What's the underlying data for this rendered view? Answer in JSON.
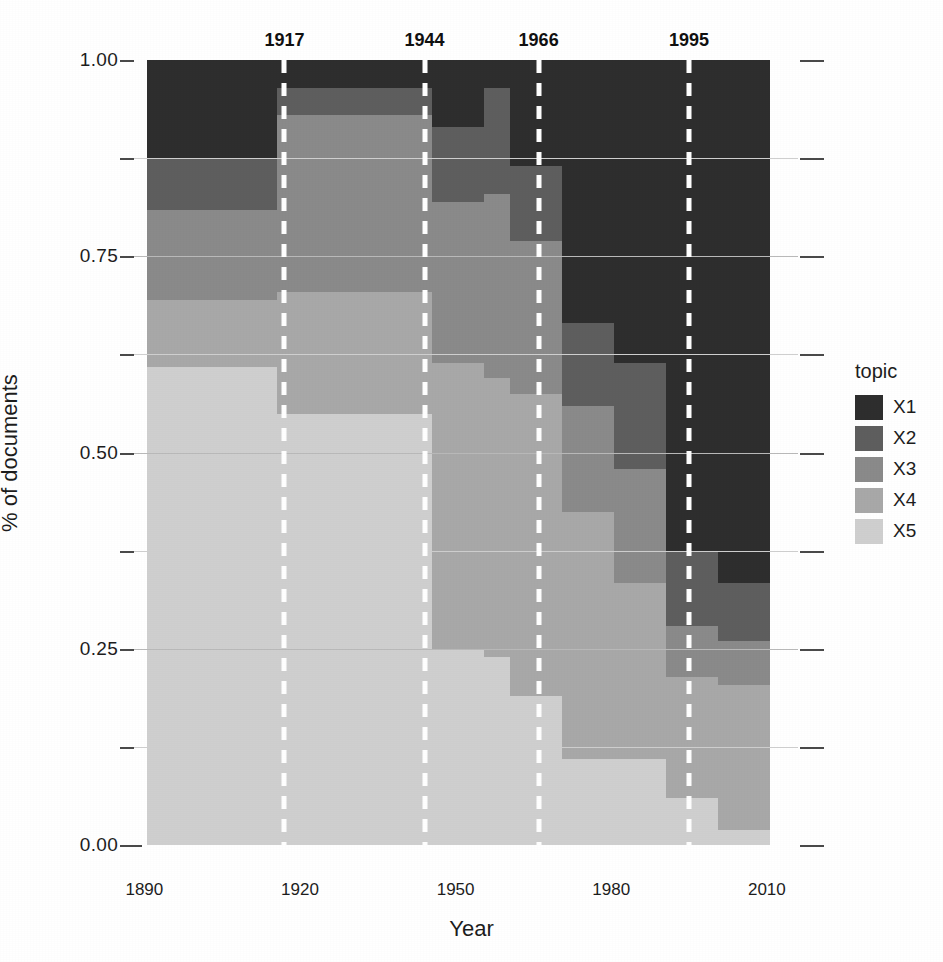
{
  "chart_data": {
    "type": "area",
    "title": "",
    "xlabel": "Year",
    "ylabel": "% of documents",
    "xlim": [
      1888,
      2016
    ],
    "ylim": [
      0,
      1
    ],
    "grid": true,
    "legend_position": "right",
    "legend_title": "topic",
    "x_ticks": [
      "1890",
      "1920",
      "1950",
      "1980",
      "2010"
    ],
    "x_tick_values": [
      1890,
      1920,
      1950,
      1980,
      2010
    ],
    "y_ticks": [
      "0.00",
      "0.25",
      "0.50",
      "0.75",
      "1.00"
    ],
    "y_tick_values": [
      0.0,
      0.25,
      0.5,
      0.75,
      1.0
    ],
    "y_minor_values": [
      0.125,
      0.375,
      0.625,
      0.875
    ],
    "annotations": [
      {
        "label": "1917",
        "x": 1917
      },
      {
        "label": "1944",
        "x": 1944
      },
      {
        "label": "1966",
        "x": 1966
      },
      {
        "label": "1995",
        "x": 1995
      }
    ],
    "bin_width": 5,
    "x_bins": [
      1893,
      1898,
      1903,
      1908,
      1913,
      1918,
      1923,
      1928,
      1933,
      1938,
      1943,
      1948,
      1953,
      1958,
      1963,
      1968,
      1973,
      1978,
      1983,
      1988,
      1993,
      1998,
      2003,
      2008
    ],
    "series": [
      {
        "name": "X1",
        "color": "#2e2e2e",
        "values": [
          0.125,
          0.125,
          0.125,
          0.125,
          0.125,
          0.035,
          0.035,
          0.035,
          0.035,
          0.035,
          0.035,
          0.085,
          0.085,
          0.035,
          0.135,
          0.135,
          0.335,
          0.335,
          0.385,
          0.385,
          0.625,
          0.625,
          0.665,
          0.665
        ]
      },
      {
        "name": "X2",
        "color": "#5e5e5e",
        "values": [
          0.065,
          0.065,
          0.065,
          0.065,
          0.065,
          0.035,
          0.035,
          0.035,
          0.035,
          0.035,
          0.035,
          0.095,
          0.095,
          0.135,
          0.095,
          0.095,
          0.105,
          0.105,
          0.135,
          0.135,
          0.095,
          0.095,
          0.075,
          0.075
        ]
      },
      {
        "name": "X3",
        "color": "#8a8a8a",
        "values": [
          0.115,
          0.115,
          0.115,
          0.115,
          0.115,
          0.225,
          0.225,
          0.225,
          0.225,
          0.225,
          0.225,
          0.205,
          0.205,
          0.235,
          0.195,
          0.195,
          0.135,
          0.135,
          0.145,
          0.145,
          0.065,
          0.065,
          0.055,
          0.055
        ]
      },
      {
        "name": "X4",
        "color": "#a8a8a8",
        "values": [
          0.085,
          0.085,
          0.085,
          0.085,
          0.085,
          0.155,
          0.155,
          0.155,
          0.155,
          0.155,
          0.155,
          0.365,
          0.365,
          0.355,
          0.385,
          0.385,
          0.315,
          0.315,
          0.225,
          0.225,
          0.155,
          0.155,
          0.185,
          0.185
        ]
      },
      {
        "name": "X5",
        "color": "#cfcfcf",
        "values": [
          0.61,
          0.61,
          0.61,
          0.61,
          0.61,
          0.55,
          0.55,
          0.55,
          0.55,
          0.55,
          0.55,
          0.25,
          0.25,
          0.24,
          0.19,
          0.19,
          0.11,
          0.11,
          0.11,
          0.11,
          0.06,
          0.06,
          0.02,
          0.02
        ]
      }
    ]
  },
  "axes": {
    "x_title": "Year",
    "y_title": "% of documents"
  },
  "legend": {
    "title": "topic",
    "items": [
      {
        "label": "X1",
        "color": "#2e2e2e"
      },
      {
        "label": "X2",
        "color": "#5e5e5e"
      },
      {
        "label": "X3",
        "color": "#8a8a8a"
      },
      {
        "label": "X4",
        "color": "#a8a8a8"
      },
      {
        "label": "X5",
        "color": "#cfcfcf"
      }
    ]
  }
}
